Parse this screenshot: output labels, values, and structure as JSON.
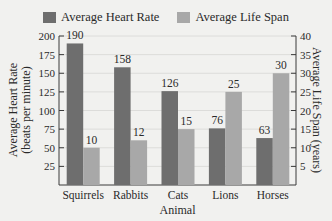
{
  "title_fragment": "",
  "legend": [
    {
      "label": "Average Heart Rate",
      "color": "#6e6e6e"
    },
    {
      "label": "Average Life Span",
      "color": "#a8a8a8"
    }
  ],
  "axes": {
    "left_title_line1": "Average Heart Rate",
    "left_title_line2": "(beats per minute)",
    "right_title": "Average Life Span (years)",
    "x_title": "Animal"
  },
  "chart_data": {
    "type": "bar",
    "title": "",
    "xlabel": "Animal",
    "ylabel": "Average Heart Rate (beats per minute)",
    "y2label": "Average Life Span (years)",
    "categories": [
      "Squirrels",
      "Rabbits",
      "Cats",
      "Lions",
      "Horses"
    ],
    "series": [
      {
        "name": "Average Heart Rate",
        "axis": "left",
        "color": "#6e6e6e",
        "values": [
          190,
          158,
          126,
          76,
          63
        ]
      },
      {
        "name": "Average Life Span",
        "axis": "right",
        "color": "#a8a8a8",
        "values": [
          10,
          12,
          15,
          25,
          30
        ]
      }
    ],
    "ylim": [
      0,
      200
    ],
    "y2lim": [
      0,
      40
    ],
    "yticks": [
      25,
      50,
      75,
      100,
      125,
      150,
      175,
      200
    ],
    "y2ticks": [
      5,
      10,
      15,
      20,
      25,
      30,
      35,
      40
    ],
    "grid": true,
    "legend_position": "top"
  }
}
